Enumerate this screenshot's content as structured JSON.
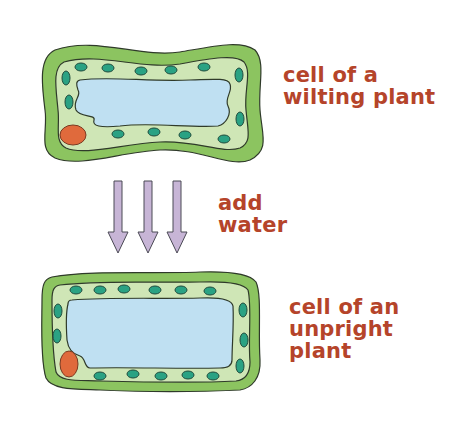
{
  "diagram": {
    "top_cell": {
      "label_line1": "cell of a",
      "label_line2": "wilting plant"
    },
    "arrows": {
      "label_line1": "add",
      "label_line2": "water",
      "count": 3
    },
    "bottom_cell": {
      "label_line1": "cell of an",
      "label_line2": "unpright",
      "label_line3": "plant"
    },
    "colors": {
      "cell_wall": "#8cc460",
      "cytoplasm": "#cfe6b6",
      "vacuole": "#bfe0f2",
      "chloroplast": "#2aa283",
      "nucleus": "#e06a3c",
      "arrow": "#c7b5d6",
      "label": "#b5442a"
    }
  }
}
